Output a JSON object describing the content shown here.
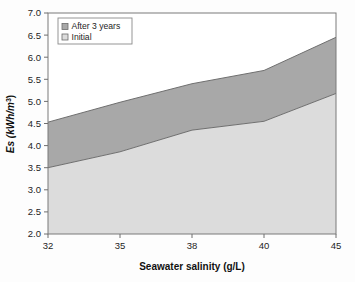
{
  "chart_data": {
    "type": "area",
    "stacked": true,
    "title": "",
    "subtitle": "",
    "xlabel": "Seawater salinity (g/L)",
    "ylabel": "Es (kWh/m3)",
    "ylabel_base": "Es (kWh/m",
    "ylabel_sup": "3",
    "ylabel_tail": ")",
    "categories": [
      "32",
      "35",
      "38",
      "40",
      "45"
    ],
    "x": [
      32,
      35,
      38,
      40,
      45
    ],
    "series": [
      {
        "name": "After 3 years",
        "values": [
          4.53,
          4.98,
          5.4,
          5.7,
          6.45
        ],
        "color": "#a8a8a8",
        "order": 2
      },
      {
        "name": "Initial",
        "values": [
          3.5,
          3.86,
          4.35,
          4.55,
          5.18
        ],
        "color": "#dcdcdc",
        "order": 1
      }
    ],
    "ylim": [
      2.0,
      7.0
    ],
    "ytick_step": 0.5,
    "yticks": [
      "7.0",
      "6.5",
      "6.0",
      "5.5",
      "5.0",
      "4.5",
      "4.0",
      "3.5",
      "3.0",
      "2.5",
      "2.0"
    ],
    "ytick_values": [
      7.0,
      6.5,
      6.0,
      5.5,
      5.0,
      4.5,
      4.0,
      3.5,
      3.0,
      2.5,
      2.0
    ],
    "grid": false,
    "legend_position": "top-left",
    "legend": [
      {
        "label": "After 3 years",
        "color": "#a8a8a8"
      },
      {
        "label": "Initial",
        "color": "#dcdcdc"
      }
    ]
  },
  "plot": {
    "frame_color": "#7a7a7a",
    "background": "#fdfdfd",
    "plot_background": "#ffffff"
  }
}
